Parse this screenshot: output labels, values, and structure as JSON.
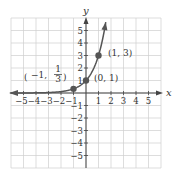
{
  "chart_data": {
    "type": "line",
    "title": "",
    "function": "y = 3^x",
    "xlabel": "x",
    "ylabel": "y",
    "xlim": [
      -6,
      6
    ],
    "ylim": [
      -6,
      6
    ],
    "grid": true,
    "x_ticks": [
      -5,
      -4,
      -3,
      -2,
      -1,
      1,
      2,
      3,
      4,
      5
    ],
    "y_ticks": [
      -5,
      -4,
      -3,
      -2,
      -1,
      1,
      2,
      3,
      4,
      5
    ],
    "x_tick_labels": [
      "-5",
      "-4",
      "-3",
      "-2",
      "-1",
      "1",
      "2",
      "3",
      "4",
      "5"
    ],
    "y_tick_labels": [
      "-5",
      "-4",
      "-3",
      "-2",
      "-1",
      "1",
      "2",
      "3",
      "4",
      "5"
    ],
    "points": [
      {
        "x": -1,
        "y": 0.3333,
        "label_main": "(−1, ",
        "label_num": "1",
        "label_den": "3",
        "label_close": ")"
      },
      {
        "x": 0,
        "y": 1,
        "label": "(0, 1)"
      },
      {
        "x": 1,
        "y": 3,
        "label": "(1, 3)"
      }
    ],
    "curve_domain": [
      -6,
      1.58
    ],
    "legend": null
  },
  "colors": {
    "grid": "#cfcfcf",
    "axis": "#444444",
    "curve": "#555555",
    "point": "#555555"
  }
}
